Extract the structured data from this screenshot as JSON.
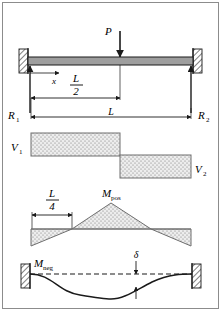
{
  "figure": {
    "border_color": "#8c8c8c",
    "line_color": "#1a1a1a",
    "beam_fill": "#9e9e9e",
    "hatch_fill": "#d9d9d9",
    "stipple_fill": "#ededed"
  },
  "beam": {
    "load_label": "P",
    "x_label": "x",
    "half_span_numerator": "L",
    "half_span_denominator": "2",
    "span_label": "L",
    "reaction_left": "R",
    "reaction_left_sub": "1",
    "reaction_right": "R",
    "reaction_right_sub": "2"
  },
  "shear": {
    "v_left": "V",
    "v_left_sub": "1",
    "v_right": "V",
    "v_right_sub": "2"
  },
  "moment": {
    "quarter_numerator": "L",
    "quarter_denominator": "4",
    "m_pos": "M",
    "m_pos_sub": "pos"
  },
  "deflection": {
    "m_neg": "M",
    "m_neg_sub": "neg",
    "delta": "δ"
  }
}
